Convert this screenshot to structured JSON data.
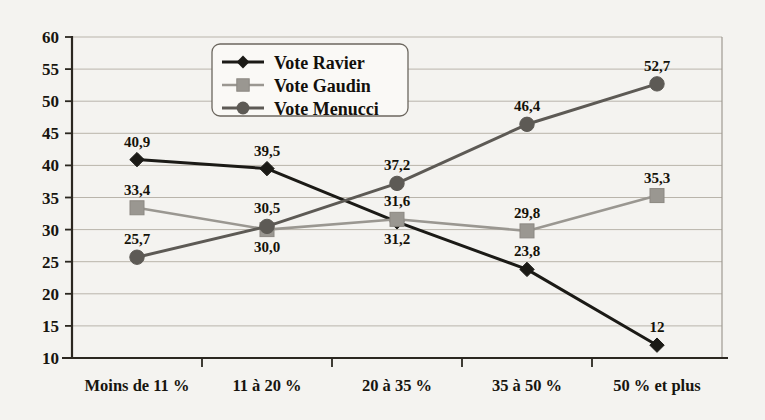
{
  "chart_data": {
    "type": "line",
    "title": "",
    "subtitle": "",
    "xlabel": "",
    "ylabel": "",
    "categories": [
      "Moins de 11 %",
      "11 à 20 %",
      "20 à 35 %",
      "35 à 50 %",
      "50 % et plus"
    ],
    "ylim": [
      10,
      60
    ],
    "ytick_step": 5,
    "yticks": [
      "10",
      "15",
      "20",
      "25",
      "30",
      "35",
      "40",
      "45",
      "50",
      "55",
      "60"
    ],
    "grid": true,
    "legend_position": "top-center",
    "series": [
      {
        "name": "Vote Ravier",
        "marker": "diamond",
        "color": "#1b1a16",
        "values": [
          40.9,
          39.5,
          31.2,
          23.8,
          12
        ],
        "labels": [
          "40,9",
          "39,5",
          "31,2",
          "23,8",
          "12"
        ],
        "label_side": [
          "above",
          "above",
          "below",
          "above",
          "above"
        ]
      },
      {
        "name": "Vote Gaudin",
        "marker": "square",
        "color": "#9a9791",
        "values": [
          33.4,
          30.0,
          31.6,
          29.8,
          35.3
        ],
        "labels": [
          "33,4",
          "30,0",
          "31,6",
          "29,8",
          "35,3"
        ],
        "label_side": [
          "above",
          "below",
          "above",
          "above",
          "above"
        ]
      },
      {
        "name": "Vote Menucci",
        "marker": "circle",
        "color": "#5d5a55",
        "values": [
          25.7,
          30.5,
          37.2,
          46.4,
          52.7
        ],
        "labels": [
          "25,7",
          "30,5",
          "37,2",
          "46,4",
          "52,7"
        ],
        "label_side": [
          "above",
          "above",
          "above",
          "above",
          "above"
        ]
      }
    ]
  },
  "legend": {
    "items": [
      {
        "label": "Vote Ravier"
      },
      {
        "label": "Vote Gaudin"
      },
      {
        "label": "Vote Menucci"
      }
    ]
  },
  "colors": {
    "background": "#f4f3f0",
    "axis": "#2b2720",
    "grid": "#b9b4ab",
    "series_ravier": "#1b1a16",
    "series_gaudin": "#9a9791",
    "series_menucci": "#5d5a55"
  }
}
